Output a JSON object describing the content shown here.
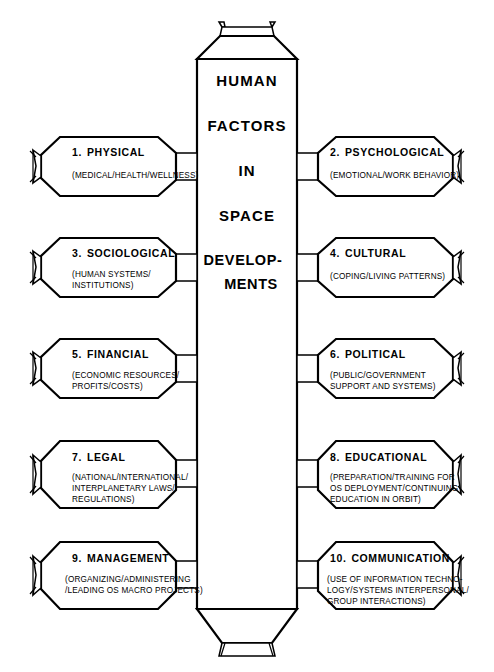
{
  "diagram": {
    "core": {
      "lines": [
        "HUMAN",
        "FACTORS",
        "IN",
        "SPACE",
        "DEVELOP-",
        "MENTS"
      ]
    },
    "modules": [
      {
        "number": "1.",
        "label": "PHYSICAL",
        "detail": "(MEDICAL/HEALTH/WELLNESS)",
        "side": "left",
        "row": 1
      },
      {
        "number": "2.",
        "label": "PSYCHOLOGICAL",
        "detail": "(EMOTIONAL/WORK BEHAVIOR)",
        "side": "right",
        "row": 1
      },
      {
        "number": "3.",
        "label": "SOCIOLOGICAL",
        "detail": "(HUMAN SYSTEMS/\nINSTITUTIONS)",
        "side": "left",
        "row": 2
      },
      {
        "number": "4.",
        "label": "CULTURAL",
        "detail": "(COPING/LIVING PATTERNS)",
        "side": "right",
        "row": 2
      },
      {
        "number": "5.",
        "label": "FINANCIAL",
        "detail": "(ECONOMIC RESOURCES/\nPROFITS/COSTS)",
        "side": "left",
        "row": 3
      },
      {
        "number": "6.",
        "label": "POLITICAL",
        "detail": "(PUBLIC/GOVERNMENT\nSUPPORT AND SYSTEMS)",
        "side": "right",
        "row": 3
      },
      {
        "number": "7.",
        "label": "LEGAL",
        "detail": "(NATIONAL/INTERNATIONAL/\nINTERPLANETARY LAWS/\nREGULATIONS)",
        "side": "left",
        "row": 4
      },
      {
        "number": "8.",
        "label": "EDUCATIONAL",
        "detail": "(PREPARATION/TRAINING FOR\nOS DEPLOYMENT/CONTINUING\nEDUCATION IN ORBIT)",
        "side": "right",
        "row": 4
      },
      {
        "number": "9.",
        "label": "MANAGEMENT",
        "detail": "(ORGANIZING/ADMINISTERING\n/LEADING OS MACRO PROJECTS)",
        "side": "left",
        "row": 5
      },
      {
        "number": "10.",
        "label": "COMMUNICATION",
        "detail": "(USE OF INFORMATION TECHNO-\nLOGY/SYSTEMS INTERPERSONAL/\nGROUP INTERACTIONS)",
        "side": "right",
        "row": 5
      }
    ],
    "colors": {
      "stroke": "#000000",
      "fill": "#ffffff",
      "background": "#ffffff"
    }
  }
}
